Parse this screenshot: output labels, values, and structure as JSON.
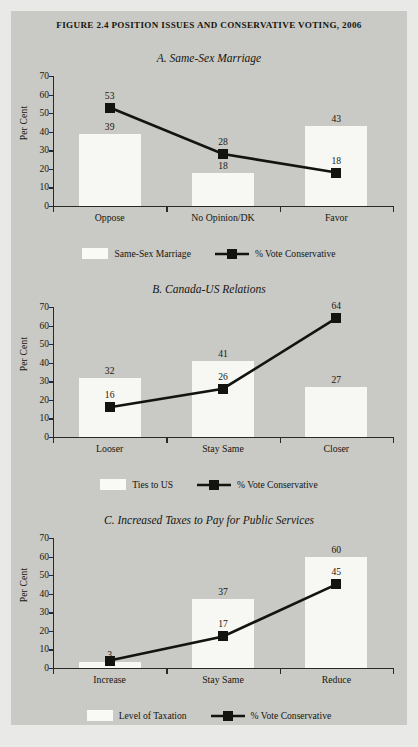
{
  "figure": {
    "title": "Figure 2.4 Position Issues and Conservative Voting, 2006",
    "ylabel": "Per Cent",
    "yticks": [
      "0",
      "10",
      "20",
      "30",
      "40",
      "50",
      "60",
      "70"
    ]
  },
  "chart_data": [
    {
      "type": "bar",
      "title": "A. Same-Sex Marriage",
      "categories": [
        "Oppose",
        "No Opinion/DK",
        "Favor"
      ],
      "series": [
        {
          "name": "Same-Sex Marriage",
          "type": "bar",
          "values": [
            39,
            18,
            43
          ]
        },
        {
          "name": "% Vote Conservative",
          "type": "line",
          "values": [
            53,
            28,
            18
          ]
        }
      ],
      "xlabel": "",
      "ylabel": "Per Cent",
      "ylim": [
        0,
        70
      ],
      "grid": false,
      "legend_position": "bottom"
    },
    {
      "type": "bar",
      "title": "B. Canada-US Relations",
      "categories": [
        "Looser",
        "Stay Same",
        "Closer"
      ],
      "series": [
        {
          "name": "Ties to US",
          "type": "bar",
          "values": [
            32,
            41,
            27
          ]
        },
        {
          "name": "% Vote Conservative",
          "type": "line",
          "values": [
            16,
            26,
            64
          ]
        }
      ],
      "xlabel": "",
      "ylabel": "Per Cent",
      "ylim": [
        0,
        70
      ],
      "grid": false,
      "legend_position": "bottom"
    },
    {
      "type": "bar",
      "title": "C. Increased Taxes to Pay for Public Services",
      "categories": [
        "Increase",
        "Stay Same",
        "Reduce"
      ],
      "series": [
        {
          "name": "Level of Taxation",
          "type": "bar",
          "values": [
            3,
            37,
            60
          ]
        },
        {
          "name": "% Vote Conservative",
          "type": "line",
          "values": [
            4,
            17,
            45
          ]
        }
      ],
      "xlabel": "",
      "ylabel": "Per Cent",
      "ylim": [
        0,
        70
      ],
      "grid": false,
      "legend_position": "bottom"
    }
  ],
  "panelA": {
    "title": "A. Same-Sex Marriage",
    "ylabel": "Per Cent",
    "cats": [
      "Oppose",
      "No Opinion/DK",
      "Favor"
    ],
    "barvals": [
      "39",
      "18",
      "43"
    ],
    "linevals": [
      "53",
      "28",
      "18"
    ],
    "legend_bar": "Same-Sex Marriage",
    "legend_line": "% Vote Conservative"
  },
  "panelB": {
    "title": "B. Canada-US Relations",
    "ylabel": "Per Cent",
    "cats": [
      "Looser",
      "Stay Same",
      "Closer"
    ],
    "barvals": [
      "32",
      "41",
      "27"
    ],
    "linevals": [
      "16",
      "26",
      "64"
    ],
    "legend_bar": "Ties to US",
    "legend_line": "% Vote Conservative"
  },
  "panelC": {
    "title": "C. Increased Taxes to Pay for Public Services",
    "ylabel": "Per Cent",
    "cats": [
      "Increase",
      "Stay Same",
      "Reduce"
    ],
    "barvals": [
      "3",
      "37",
      "60"
    ],
    "linevals": [
      "3",
      "17",
      "45"
    ],
    "legend_bar": "Level of Taxation",
    "legend_line": "% Vote Conservative"
  },
  "colors": {
    "page": "#c9c9c5",
    "bar": "#f7f7f4",
    "ink": "#17170f",
    "marker": "#131310"
  }
}
